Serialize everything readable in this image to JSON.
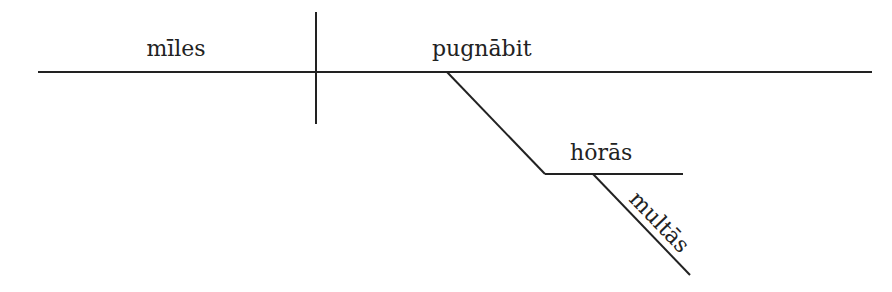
{
  "diagram": {
    "type": "sentence-diagram",
    "subject": "mīles",
    "verb": "pugnābit",
    "modifier": "hōrās",
    "modifier_of_modifier": "multās"
  },
  "colors": {
    "ink": "#222222",
    "background": "#ffffff"
  }
}
